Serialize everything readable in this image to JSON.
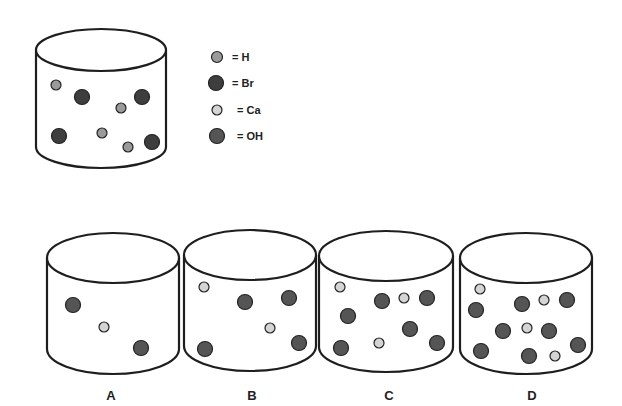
{
  "colors": {
    "H": "#9a9a9a",
    "Br": "#3e3e3e",
    "Ca": "#d4d4d4",
    "OH": "#555555",
    "stroke": "#1e1e1e"
  },
  "legend": [
    {
      "species": "H",
      "label": "= H",
      "cx": 217,
      "cy": 57,
      "r": 5.5
    },
    {
      "species": "Br",
      "label": "= Br",
      "cx": 216,
      "cy": 83,
      "r": 7.5
    },
    {
      "species": "Ca",
      "label": "= Ca",
      "cx": 217,
      "cy": 110,
      "r": 5
    },
    {
      "species": "OH",
      "label": "= OH",
      "cx": 217,
      "cy": 136,
      "r": 7.5
    }
  ],
  "reference_beaker": {
    "particles": [
      {
        "species": "H",
        "cx": 56,
        "cy": 85,
        "r": 5
      },
      {
        "species": "Br",
        "cx": 82,
        "cy": 97,
        "r": 7.5
      },
      {
        "species": "Br",
        "cx": 142,
        "cy": 97,
        "r": 7.5
      },
      {
        "species": "H",
        "cx": 121,
        "cy": 108,
        "r": 5
      },
      {
        "species": "Br",
        "cx": 59,
        "cy": 136,
        "r": 7.5
      },
      {
        "species": "H",
        "cx": 102,
        "cy": 133,
        "r": 5
      },
      {
        "species": "H",
        "cx": 128,
        "cy": 147,
        "r": 5
      },
      {
        "species": "Br",
        "cx": 152,
        "cy": 142,
        "r": 7.5
      }
    ]
  },
  "options": [
    {
      "label": "A",
      "label_x": 111,
      "particles": [
        {
          "species": "OH",
          "cx": 73,
          "cy": 305,
          "r": 7.5
        },
        {
          "species": "Ca",
          "cx": 104,
          "cy": 327,
          "r": 5
        },
        {
          "species": "OH",
          "cx": 141,
          "cy": 348,
          "r": 7.5
        }
      ]
    },
    {
      "label": "B",
      "label_x": 252,
      "particles": [
        {
          "species": "Ca",
          "cx": 204,
          "cy": 287,
          "r": 5
        },
        {
          "species": "OH",
          "cx": 245,
          "cy": 302,
          "r": 7.5
        },
        {
          "species": "OH",
          "cx": 289,
          "cy": 298,
          "r": 7.5
        },
        {
          "species": "Ca",
          "cx": 270,
          "cy": 328,
          "r": 5
        },
        {
          "species": "OH",
          "cx": 205,
          "cy": 349,
          "r": 7.5
        },
        {
          "species": "OH",
          "cx": 299,
          "cy": 343,
          "r": 7.5
        }
      ]
    },
    {
      "label": "C",
      "label_x": 389,
      "particles": [
        {
          "species": "Ca",
          "cx": 340,
          "cy": 287,
          "r": 5
        },
        {
          "species": "OH",
          "cx": 382,
          "cy": 301,
          "r": 7.5
        },
        {
          "species": "Ca",
          "cx": 404,
          "cy": 298,
          "r": 5
        },
        {
          "species": "OH",
          "cx": 427,
          "cy": 298,
          "r": 7.5
        },
        {
          "species": "OH",
          "cx": 348,
          "cy": 316,
          "r": 7.5
        },
        {
          "species": "OH",
          "cx": 410,
          "cy": 329,
          "r": 7.5
        },
        {
          "species": "Ca",
          "cx": 379,
          "cy": 343,
          "r": 5
        },
        {
          "species": "OH",
          "cx": 341,
          "cy": 348,
          "r": 7.5
        },
        {
          "species": "OH",
          "cx": 437,
          "cy": 343,
          "r": 7.5
        }
      ]
    },
    {
      "label": "D",
      "label_x": 532,
      "particles": [
        {
          "species": "Ca",
          "cx": 480,
          "cy": 289,
          "r": 5
        },
        {
          "species": "OH",
          "cx": 476,
          "cy": 310,
          "r": 7.5
        },
        {
          "species": "OH",
          "cx": 522,
          "cy": 304,
          "r": 7.5
        },
        {
          "species": "Ca",
          "cx": 544,
          "cy": 300,
          "r": 5
        },
        {
          "species": "OH",
          "cx": 567,
          "cy": 300,
          "r": 7.5
        },
        {
          "species": "OH",
          "cx": 503,
          "cy": 331,
          "r": 7.5
        },
        {
          "species": "Ca",
          "cx": 527,
          "cy": 328,
          "r": 5
        },
        {
          "species": "OH",
          "cx": 549,
          "cy": 331,
          "r": 7.5
        },
        {
          "species": "OH",
          "cx": 578,
          "cy": 345,
          "r": 7.5
        },
        {
          "species": "OH",
          "cx": 481,
          "cy": 351,
          "r": 7.5
        },
        {
          "species": "OH",
          "cx": 529,
          "cy": 356,
          "r": 7.5
        },
        {
          "species": "Ca",
          "cx": 555,
          "cy": 356,
          "r": 5
        }
      ]
    }
  ]
}
